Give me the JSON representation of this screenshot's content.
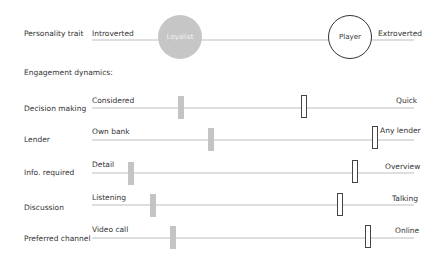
{
  "personality": {
    "label": "Personality trait",
    "left": "Introverted",
    "right": "Extroverted",
    "markers": [
      {
        "name": "Loyalist",
        "style": "filled-gray",
        "x_center": 180
      },
      {
        "name": "Player",
        "style": "outline",
        "x_center": 350
      }
    ]
  },
  "section_heading": "Engagement dynamics:",
  "rows": [
    {
      "label": "Decision making",
      "left": "Considered",
      "right": "Quick",
      "gray_x": 178,
      "outline_x": 301
    },
    {
      "label": "Lender",
      "left": "Own bank",
      "right": "Any lender",
      "gray_x": 208,
      "outline_x": 372
    },
    {
      "label": "Info. required",
      "left": "Detail",
      "right": "Overview",
      "gray_x": 128,
      "outline_x": 352
    },
    {
      "label": "Discussion",
      "left": "Listening",
      "right": "Talking",
      "gray_x": 150,
      "outline_x": 337
    },
    {
      "label": "Preferred channel",
      "left": "Video call",
      "right": "Online",
      "gray_x": 170,
      "outline_x": 365
    }
  ],
  "colors": {
    "track": "#dedede",
    "loyalist_fill": "#c6c6c6",
    "player_outline": "#333333",
    "gray_marker": "#c4c4c4"
  }
}
